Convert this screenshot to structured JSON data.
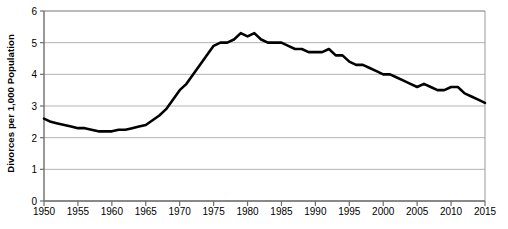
{
  "chart_data": {
    "type": "line",
    "title": "",
    "xlabel": "",
    "ylabel": "Divorces per 1,000 Population",
    "xlim": [
      1950,
      2015
    ],
    "ylim": [
      0,
      6
    ],
    "ytick_labels": [
      "0",
      "1",
      "2",
      "3",
      "4",
      "5",
      "6"
    ],
    "yticks": [
      0,
      1,
      2,
      3,
      4,
      5,
      6
    ],
    "xtick_labels": [
      "1950",
      "1955",
      "1960",
      "1965",
      "1970",
      "1975",
      "1980",
      "1985",
      "1990",
      "1995",
      "2000",
      "2005",
      "2010",
      "2015"
    ],
    "xticks": [
      1950,
      1955,
      1960,
      1965,
      1970,
      1975,
      1980,
      1985,
      1990,
      1995,
      2000,
      2005,
      2010,
      2015
    ],
    "grid": "horizontal",
    "legend": "none",
    "line_color": "#000000",
    "line_width": 2.6,
    "grid_color": "#b3b3b3",
    "frame_color": "#9a9a9a",
    "x": [
      1950,
      1951,
      1952,
      1953,
      1954,
      1955,
      1956,
      1957,
      1958,
      1959,
      1960,
      1961,
      1962,
      1963,
      1964,
      1965,
      1966,
      1967,
      1968,
      1969,
      1970,
      1971,
      1972,
      1973,
      1974,
      1975,
      1976,
      1977,
      1978,
      1979,
      1980,
      1981,
      1982,
      1983,
      1984,
      1985,
      1986,
      1987,
      1988,
      1989,
      1990,
      1991,
      1992,
      1993,
      1994,
      1995,
      1996,
      1997,
      1998,
      1999,
      2000,
      2001,
      2002,
      2003,
      2004,
      2005,
      2006,
      2007,
      2008,
      2009,
      2010,
      2011,
      2012,
      2013,
      2014,
      2015
    ],
    "values": [
      2.6,
      2.5,
      2.45,
      2.4,
      2.35,
      2.3,
      2.3,
      2.25,
      2.2,
      2.2,
      2.2,
      2.25,
      2.25,
      2.3,
      2.35,
      2.4,
      2.55,
      2.7,
      2.9,
      3.2,
      3.5,
      3.7,
      4.0,
      4.3,
      4.6,
      4.9,
      5.0,
      5.0,
      5.1,
      5.3,
      5.2,
      5.3,
      5.1,
      5.0,
      5.0,
      5.0,
      4.9,
      4.8,
      4.8,
      4.7,
      4.7,
      4.7,
      4.8,
      4.6,
      4.6,
      4.4,
      4.3,
      4.3,
      4.2,
      4.1,
      4.0,
      4.0,
      3.9,
      3.8,
      3.7,
      3.6,
      3.7,
      3.6,
      3.5,
      3.5,
      3.6,
      3.6,
      3.4,
      3.3,
      3.2,
      3.1
    ],
    "annotations": []
  }
}
